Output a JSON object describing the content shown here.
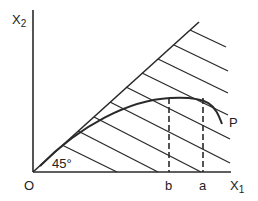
{
  "diagram": {
    "y_axis_label": "X",
    "y_axis_sub": "2",
    "x_axis_label": "X",
    "x_axis_sub": "1",
    "origin_label": "O",
    "angle_label": "45°",
    "curve_label": "P",
    "tick_b": "b",
    "tick_a": "a",
    "line_color": "#2a2a2a"
  }
}
